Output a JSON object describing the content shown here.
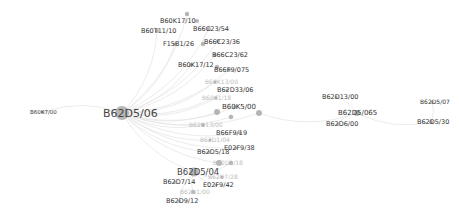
{
  "graph": {
    "type": "network",
    "colors": {
      "node": "#a9a9a9",
      "edge": "#e6e6e6",
      "label": "#333333",
      "label_faint": "#bdbdbd",
      "background": "#ffffff"
    },
    "nodes": [
      {
        "id": "B62D5/06",
        "label": "B62D5/06",
        "x": 122,
        "y": 113,
        "r": 7,
        "lx": 103,
        "ly": 117,
        "fs": 11,
        "cls": "big"
      },
      {
        "id": "B62D5/04",
        "label": "B62D5/04",
        "x": 194,
        "y": 172,
        "r": 4.5,
        "lx": 177,
        "ly": 175,
        "fs": 8.5,
        "cls": "big"
      },
      {
        "id": "B60K17/10",
        "label": "B60K17/10",
        "x": 187,
        "y": 14,
        "r": 2.2,
        "lx": 160,
        "ly": 23,
        "fs": 6.5,
        "cls": ""
      },
      {
        "id": "n_top2",
        "label": "",
        "x": 197,
        "y": 21,
        "r": 2,
        "lx": 0,
        "ly": 0,
        "fs": 6.5,
        "cls": ""
      },
      {
        "id": "B60T11/10",
        "label": "B60T11/10",
        "x": 157,
        "y": 31,
        "r": 2,
        "lx": 141,
        "ly": 33,
        "fs": 6.5,
        "cls": ""
      },
      {
        "id": "B66C23/54",
        "label": "B66C23/54",
        "x": 209,
        "y": 29,
        "r": 2,
        "lx": 193,
        "ly": 31,
        "fs": 6.5,
        "cls": ""
      },
      {
        "id": "B66C23/36",
        "label": "B66C23/36",
        "x": 218,
        "y": 41,
        "r": 2,
        "lx": 204,
        "ly": 44,
        "fs": 6.5,
        "cls": ""
      },
      {
        "id": "n_3636",
        "label": "",
        "x": 203,
        "y": 44,
        "r": 2.2,
        "lx": 0,
        "ly": 0,
        "fs": 6.5,
        "cls": ""
      },
      {
        "id": "F15B1/26",
        "label": "F15B1/26",
        "x": 175,
        "y": 44,
        "r": 1.8,
        "lx": 163,
        "ly": 46,
        "fs": 6.5,
        "cls": ""
      },
      {
        "id": "B66C23/62",
        "label": "B66C23/62",
        "x": 215,
        "y": 55,
        "r": 1.8,
        "lx": 212,
        "ly": 57,
        "fs": 6.5,
        "cls": ""
      },
      {
        "id": "B60K17/12",
        "label": "B60K17/12",
        "x": 191,
        "y": 65,
        "r": 1.8,
        "lx": 178,
        "ly": 67,
        "fs": 6.5,
        "cls": ""
      },
      {
        "id": "B66F9/075",
        "label": "B66F9/075",
        "x": 229,
        "y": 70,
        "r": 2,
        "lx": 214,
        "ly": 72,
        "fs": 6.5,
        "cls": ""
      },
      {
        "id": "n_075a",
        "label": "",
        "x": 217,
        "y": 67,
        "r": 2.2,
        "lx": 0,
        "ly": 0,
        "fs": 6.5,
        "cls": ""
      },
      {
        "id": "B60K13/00",
        "label": "B60K13/00",
        "x": 215,
        "y": 82,
        "r": 1.5,
        "lx": 205,
        "ly": 84,
        "fs": 6,
        "cls": "faint"
      },
      {
        "id": "B62D33/06",
        "label": "B62D33/06",
        "x": 227,
        "y": 90,
        "r": 1.5,
        "lx": 217,
        "ly": 92,
        "fs": 6.5,
        "cls": ""
      },
      {
        "id": "B60K1/18",
        "label": "B60K1/18",
        "x": 216,
        "y": 98,
        "r": 1.5,
        "lx": 202,
        "ly": 100,
        "fs": 6,
        "cls": "faint"
      },
      {
        "id": "B60K5/00",
        "label": "B60K5/00",
        "x": 235,
        "y": 107,
        "r": 1.8,
        "lx": 222,
        "ly": 109,
        "fs": 7,
        "cls": ""
      },
      {
        "id": "n_c1",
        "label": "",
        "x": 217,
        "y": 112,
        "r": 3,
        "lx": 0,
        "ly": 0,
        "fs": 6.5,
        "cls": ""
      },
      {
        "id": "n_c2",
        "label": "",
        "x": 231,
        "y": 117,
        "r": 2.3,
        "lx": 0,
        "ly": 0,
        "fs": 6.5,
        "cls": ""
      },
      {
        "id": "n_c3",
        "label": "",
        "x": 259,
        "y": 113,
        "r": 3,
        "lx": 0,
        "ly": 0,
        "fs": 6.5,
        "cls": ""
      },
      {
        "id": "B60K7/00",
        "label": "B60K7/00",
        "x": 43,
        "y": 112,
        "r": 1.5,
        "lx": 30,
        "ly": 114,
        "fs": 5.5,
        "cls": ""
      },
      {
        "id": "B62D13/00r",
        "label": "B62D13/00",
        "x": 336,
        "y": 97,
        "r": 1.5,
        "lx": 322,
        "ly": 99,
        "fs": 6.5,
        "cls": ""
      },
      {
        "id": "B62D5/065",
        "label": "B62D5/065",
        "x": 357,
        "y": 113,
        "r": 3,
        "lx": 338,
        "ly": 115,
        "fs": 7,
        "cls": ""
      },
      {
        "id": "B62D6/00",
        "label": "B62D6/00",
        "x": 338,
        "y": 124,
        "r": 1.5,
        "lx": 326,
        "ly": 126,
        "fs": 6.5,
        "cls": ""
      },
      {
        "id": "B62D5/07",
        "label": "B62D5/07",
        "x": 432,
        "y": 102,
        "r": 1.5,
        "lx": 420,
        "ly": 104,
        "fs": 6,
        "cls": ""
      },
      {
        "id": "B62D5/30",
        "label": "B62D5/30",
        "x": 431,
        "y": 122,
        "r": 2,
        "lx": 417,
        "ly": 124,
        "fs": 6.5,
        "cls": ""
      },
      {
        "id": "B62D13/00",
        "label": "B62D13/00",
        "x": 203,
        "y": 125,
        "r": 1.8,
        "lx": 189,
        "ly": 127,
        "fs": 6,
        "cls": "faint"
      },
      {
        "id": "B66F9/19",
        "label": "B66F9/19",
        "x": 240,
        "y": 133,
        "r": 1.8,
        "lx": 216,
        "ly": 135,
        "fs": 6.5,
        "cls": ""
      },
      {
        "id": "B62D1/04",
        "label": "B62D1/04",
        "x": 210,
        "y": 140,
        "r": 1.5,
        "lx": 200,
        "ly": 142,
        "fs": 6,
        "cls": "faint"
      },
      {
        "id": "E02F9/38",
        "label": "E02F9/38",
        "x": 236,
        "y": 148,
        "r": 1.5,
        "lx": 224,
        "ly": 150,
        "fs": 6.5,
        "cls": ""
      },
      {
        "id": "B62D5/18",
        "label": "B62D5/18",
        "x": 209,
        "y": 152,
        "r": 1.5,
        "lx": 197,
        "ly": 154,
        "fs": 6.5,
        "cls": ""
      },
      {
        "id": "n_faint163",
        "label": "B62D1/18",
        "x": 219,
        "y": 163,
        "r": 3,
        "lx": 213,
        "ly": 165,
        "fs": 6,
        "cls": "faint"
      },
      {
        "id": "n_163b",
        "label": "",
        "x": 231,
        "y": 163,
        "r": 2.2,
        "lx": 0,
        "ly": 0,
        "fs": 6.5,
        "cls": ""
      },
      {
        "id": "B62D7/28",
        "label": "B62D7/28",
        "x": 222,
        "y": 177,
        "r": 1.5,
        "lx": 208,
        "ly": 179,
        "fs": 6,
        "cls": "faint"
      },
      {
        "id": "B62D7/14",
        "label": "B62D7/14",
        "x": 175,
        "y": 182,
        "r": 1.5,
        "lx": 163,
        "ly": 184,
        "fs": 6.5,
        "cls": ""
      },
      {
        "id": "E02F9/42",
        "label": "E02F9/42",
        "x": 216,
        "y": 185,
        "r": 1.5,
        "lx": 203,
        "ly": 187,
        "fs": 6.5,
        "cls": ""
      },
      {
        "id": "B62D_faint",
        "label": "B62D1/00",
        "x": 193,
        "y": 192,
        "r": 2,
        "lx": 180,
        "ly": 194,
        "fs": 6,
        "cls": "faint"
      },
      {
        "id": "B62D9/12",
        "label": "B62D9/12",
        "x": 179,
        "y": 201,
        "r": 1.5,
        "lx": 166,
        "ly": 203,
        "fs": 6.5,
        "cls": ""
      }
    ],
    "edges": [
      [
        "B62D5/06",
        "B60K17/10"
      ],
      [
        "B62D5/06",
        "B60T11/10"
      ],
      [
        "B62D5/06",
        "F15B1/26"
      ],
      [
        "B62D5/06",
        "B66C23/54"
      ],
      [
        "B62D5/06",
        "B66C23/36"
      ],
      [
        "B62D5/06",
        "B66C23/62"
      ],
      [
        "B62D5/06",
        "B60K17/12"
      ],
      [
        "B62D5/06",
        "B66F9/075"
      ],
      [
        "B62D5/06",
        "B60K13/00"
      ],
      [
        "B62D5/06",
        "B62D33/06"
      ],
      [
        "B62D5/06",
        "B60K1/18"
      ],
      [
        "B62D5/06",
        "B60K5/00"
      ],
      [
        "B62D5/06",
        "n_c1"
      ],
      [
        "B62D5/06",
        "n_c2"
      ],
      [
        "B62D5/06",
        "n_c3"
      ],
      [
        "B62D5/06",
        "B60K7/00"
      ],
      [
        "B62D5/06",
        "B62D13/00"
      ],
      [
        "B62D5/06",
        "B66F9/19"
      ],
      [
        "B62D5/06",
        "B62D1/04"
      ],
      [
        "B62D5/06",
        "E02F9/38"
      ],
      [
        "B62D5/06",
        "B62D5/18"
      ],
      [
        "B62D5/06",
        "B62D5/04"
      ],
      [
        "B62D5/06",
        "n_faint163"
      ],
      [
        "B62D5/04",
        "B62D7/14"
      ],
      [
        "B62D5/04",
        "E02F9/42"
      ],
      [
        "B62D5/04",
        "B62D7/28"
      ],
      [
        "B62D5/04",
        "B62D_faint"
      ],
      [
        "B62D5/04",
        "B62D9/12"
      ],
      [
        "B62D5/04",
        "n_163b"
      ],
      [
        "n_c3",
        "B62D5/065"
      ],
      [
        "B62D5/065",
        "B62D13/00r"
      ],
      [
        "B62D5/065",
        "B62D6/00"
      ],
      [
        "B62D5/065",
        "B62D5/30"
      ],
      [
        "B62D5/30",
        "B62D5/07"
      ],
      [
        "B60K17/10",
        "n_top2"
      ],
      [
        "n_top2",
        "B66C23/54"
      ],
      [
        "B66C23/54",
        "n_3636"
      ]
    ]
  }
}
